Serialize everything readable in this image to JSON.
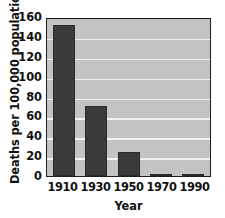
{
  "chart_data": {
    "type": "bar",
    "title": "from Tuberculosis",
    "xlabel": "Year",
    "ylabel": "Deaths per  100,000 population",
    "categories": [
      "1910",
      "1930",
      "1950",
      "1970",
      "1990"
    ],
    "values": [
      152,
      70,
      24,
      1.5,
      1
    ],
    "series": [
      {
        "name": "Deaths per 100,000 population",
        "values": [
          152,
          70,
          24,
          1.5,
          1
        ]
      }
    ],
    "ylim": [
      0,
      160
    ],
    "ytick_values": [
      0,
      20,
      40,
      60,
      80,
      100,
      120,
      140,
      160
    ],
    "ytick_labels": [
      "0",
      "20",
      "40",
      "60",
      "80",
      "100",
      "120",
      "140",
      "160"
    ],
    "grid": true,
    "grid_axis": "y",
    "legend": false,
    "legend_position": "none",
    "colors": {
      "bar": "#3a3a3a",
      "plot_background": "#c3c3c3",
      "gridline": "#f2f2f2",
      "axis": "#1d1d1d",
      "text": "#111111",
      "figure_background": "#ffffff"
    }
  }
}
